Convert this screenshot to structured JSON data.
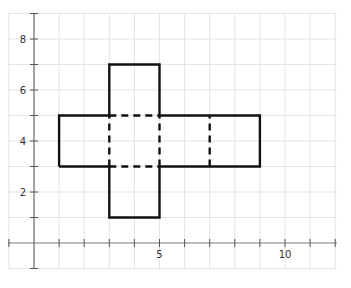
{
  "diagram": {
    "type": "cube-net-on-grid",
    "x_ticks_labeled": [
      {
        "value": 5,
        "label": "5"
      },
      {
        "value": 10,
        "label": "10"
      }
    ],
    "y_ticks_labeled": [
      {
        "value": 2,
        "label": "2"
      },
      {
        "value": 4,
        "label": "4"
      },
      {
        "value": 6,
        "label": "6"
      },
      {
        "value": 8,
        "label": "8"
      }
    ],
    "x_range": [
      -1,
      12
    ],
    "y_range": [
      -1,
      9
    ],
    "outline_color": "#111111",
    "grid_color": "#e3e3e3",
    "solid_outline": [
      [
        1,
        3
      ],
      [
        3,
        3
      ],
      [
        3,
        1
      ],
      [
        5,
        1
      ],
      [
        5,
        3
      ],
      [
        9,
        3
      ],
      [
        9,
        5
      ],
      [
        5,
        5
      ],
      [
        5,
        7
      ],
      [
        3,
        7
      ],
      [
        3,
        5
      ],
      [
        1,
        5
      ],
      [
        1,
        3
      ]
    ],
    "dashed_segments": [
      [
        [
          3,
          3
        ],
        [
          3,
          5
        ]
      ],
      [
        [
          5,
          3
        ],
        [
          5,
          5
        ]
      ],
      [
        [
          3,
          3
        ],
        [
          5,
          3
        ]
      ],
      [
        [
          3,
          5
        ],
        [
          5,
          5
        ]
      ],
      [
        [
          7,
          3
        ],
        [
          7,
          5
        ]
      ]
    ]
  }
}
